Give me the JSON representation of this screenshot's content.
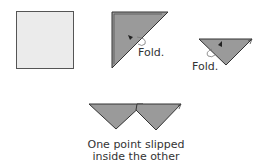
{
  "diagram": {
    "steps": [
      {
        "name": "square-paper",
        "label": ""
      },
      {
        "name": "folded-diagonal-triangle",
        "label": "Fold."
      },
      {
        "name": "folded-small-triangle",
        "label": "Fold."
      },
      {
        "name": "joined-triangles",
        "label": "One point slipped inside the other"
      }
    ],
    "caption_line1": "One point slipped",
    "caption_line2": "inside the other",
    "colors": {
      "paper": "#ebebeb",
      "paper_edge": "#555555",
      "fold_fill": "#9a9a9a",
      "fold_edge": "#333333",
      "arrow": "#222222",
      "text": "#333333"
    }
  }
}
